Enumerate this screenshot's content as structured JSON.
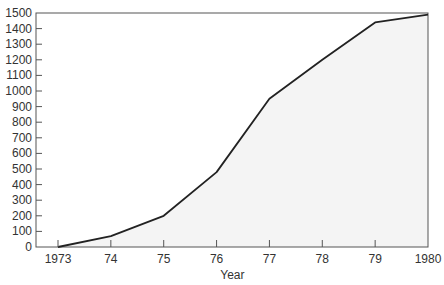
{
  "chart_data": {
    "type": "area",
    "title": "",
    "xlabel": "Year",
    "ylabel": "",
    "categories": [
      "1973",
      "74",
      "75",
      "76",
      "77",
      "78",
      "79",
      "1980"
    ],
    "x": [
      1973,
      1974,
      1975,
      1976,
      1977,
      1978,
      1979,
      1980
    ],
    "series": [
      {
        "name": "",
        "values": [
          0,
          70,
          200,
          480,
          950,
          1200,
          1440,
          1490
        ]
      }
    ],
    "ylim": [
      0,
      1500
    ],
    "yticks": [
      0,
      100,
      200,
      300,
      400,
      500,
      600,
      700,
      800,
      900,
      1000,
      1100,
      1200,
      1300,
      1400,
      1500
    ],
    "grid": false,
    "legend": "none",
    "colors": {
      "line": "#222222",
      "fill": "#f4f4f4",
      "axis": "#555555"
    }
  }
}
